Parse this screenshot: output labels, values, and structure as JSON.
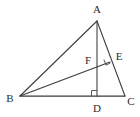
{
  "figure": {
    "background_color": "#ffffff",
    "stroke_color": "#3a3a3c",
    "label_color": "#2b2b2d",
    "width": 140,
    "height": 117,
    "points": [
      {
        "id": "A",
        "label": "A",
        "x": 97,
        "y": 21,
        "label_x": 97,
        "label_y": 9,
        "role": "apex-vertex"
      },
      {
        "id": "B",
        "label": "B",
        "x": 20,
        "y": 96,
        "label_x": 10,
        "label_y": 98,
        "role": "left-base-vertex"
      },
      {
        "id": "C",
        "label": "C",
        "x": 125,
        "y": 96,
        "label_x": 131,
        "label_y": 101,
        "role": "right-base-vertex"
      },
      {
        "id": "D",
        "label": "D",
        "x": 97,
        "y": 96,
        "label_x": 97,
        "label_y": 108,
        "role": "altitude-foot"
      },
      {
        "id": "E",
        "label": "E",
        "x": 110,
        "y": 62,
        "label_x": 119,
        "label_y": 56,
        "role": "point-on-AC"
      },
      {
        "id": "F",
        "label": "F",
        "x": 97,
        "y": 67,
        "label_x": 88,
        "label_y": 60,
        "role": "intersection-AD-BE"
      }
    ],
    "segments": [
      {
        "id": "AB",
        "from": "A",
        "to": "B",
        "style": "thin"
      },
      {
        "id": "AC",
        "from": "A",
        "to": "C",
        "style": "thin"
      },
      {
        "id": "BC",
        "from": "B",
        "to": "C",
        "style": "base"
      },
      {
        "id": "AD",
        "from": "A",
        "to": "D",
        "style": "thin"
      },
      {
        "id": "BE",
        "from": "B",
        "to": "E",
        "style": "thin"
      }
    ],
    "right_angles": [
      {
        "id": "angle-at-D",
        "at": "D",
        "label": "right-angle-D",
        "size": 5
      },
      {
        "id": "angle-at-E",
        "at": "E",
        "label": "right-angle-E",
        "size": 4.5
      }
    ]
  }
}
